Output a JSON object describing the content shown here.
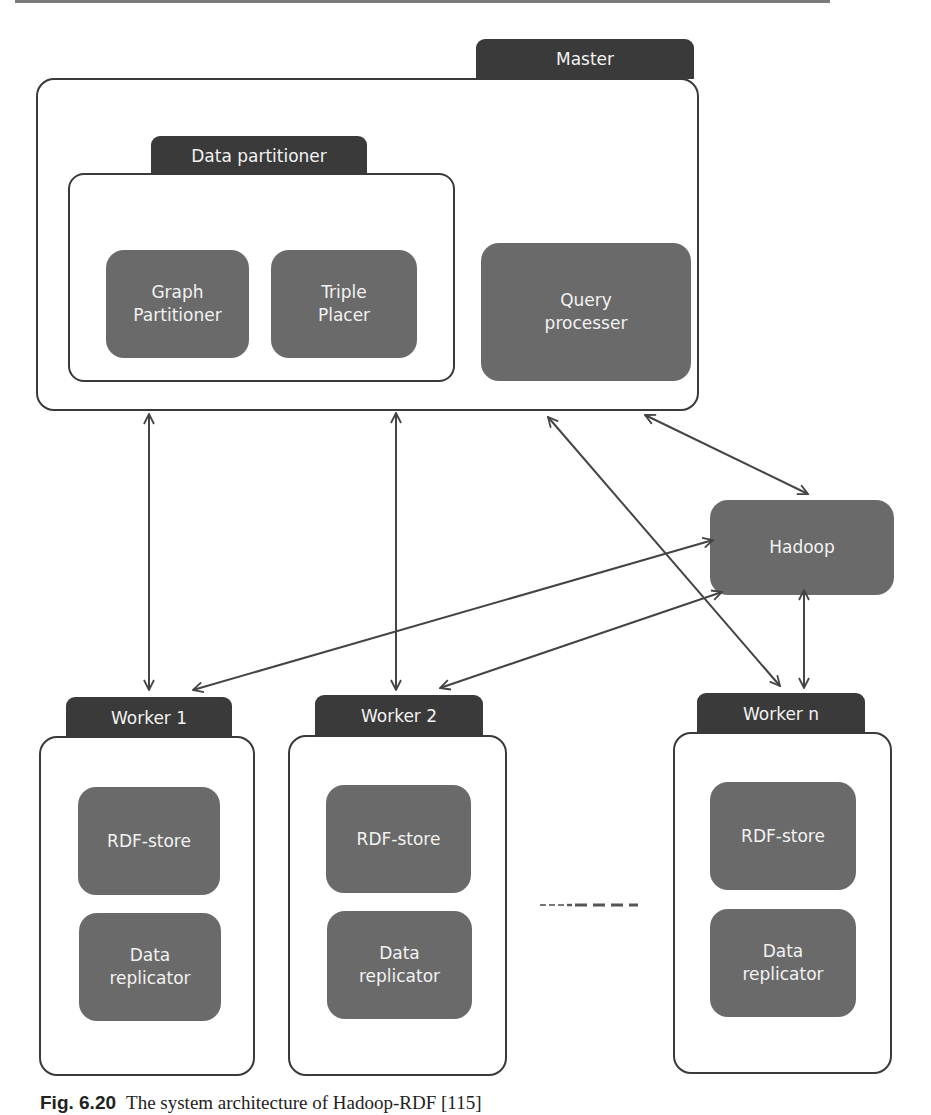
{
  "master": {
    "label": "Master",
    "data_partitioner": {
      "label": "Data partitioner",
      "components": [
        {
          "label": "Graph\nPartitioner"
        },
        {
          "label": "Triple\nPlacer"
        }
      ]
    },
    "query_processor": {
      "label": "Query\nprocesser"
    }
  },
  "hadoop": {
    "label": "Hadoop"
  },
  "workers": [
    {
      "label": "Worker 1",
      "components": [
        {
          "label": "RDF-store"
        },
        {
          "label": "Data\nreplicator"
        }
      ]
    },
    {
      "label": "Worker 2",
      "components": [
        {
          "label": "RDF-store"
        },
        {
          "label": "Data\nreplicator"
        }
      ]
    },
    {
      "label": "Worker n",
      "components": [
        {
          "label": "RDF-store"
        },
        {
          "label": "Data\nreplicator"
        }
      ]
    }
  ],
  "ellipsis": "------",
  "caption": {
    "figure": "Fig. 6.20",
    "text": "The system architecture of Hadoop-RDF [115]"
  },
  "colors": {
    "container_border": "#3a3a3a",
    "tab_fill": "#3a3a3a",
    "node_fill": "#6a6a6a",
    "text_on_dark": "#f2f2f2",
    "arrow": "#444444"
  }
}
